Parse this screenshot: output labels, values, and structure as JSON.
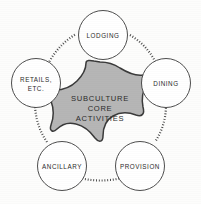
{
  "diagram": {
    "title": "Subculture Core Activities",
    "type": "hub-and-spoke",
    "background_color": "#fdfdfc",
    "core": {
      "shape": "star",
      "fill_color": "#b6b6b6",
      "stroke_color": "#3a3a3a",
      "lines": [
        "SUBCULTURE",
        "CORE",
        "ACTIVITIES"
      ]
    },
    "nodes": [
      {
        "id": "lodging",
        "position": "top",
        "lines": [
          "LODGING"
        ]
      },
      {
        "id": "dining",
        "position": "right",
        "lines": [
          "DINING"
        ]
      },
      {
        "id": "provision",
        "position": "bottom-right",
        "lines": [
          "PROVISION"
        ]
      },
      {
        "id": "ancillary",
        "position": "bottom-left",
        "lines": [
          "ANCILLARY"
        ]
      },
      {
        "id": "retails",
        "position": "left",
        "lines": [
          "RETAILS,",
          "ETC."
        ]
      }
    ],
    "connectors": {
      "style": "dashed-arc",
      "stroke_color": "#3f3f3f",
      "count": 5
    }
  }
}
